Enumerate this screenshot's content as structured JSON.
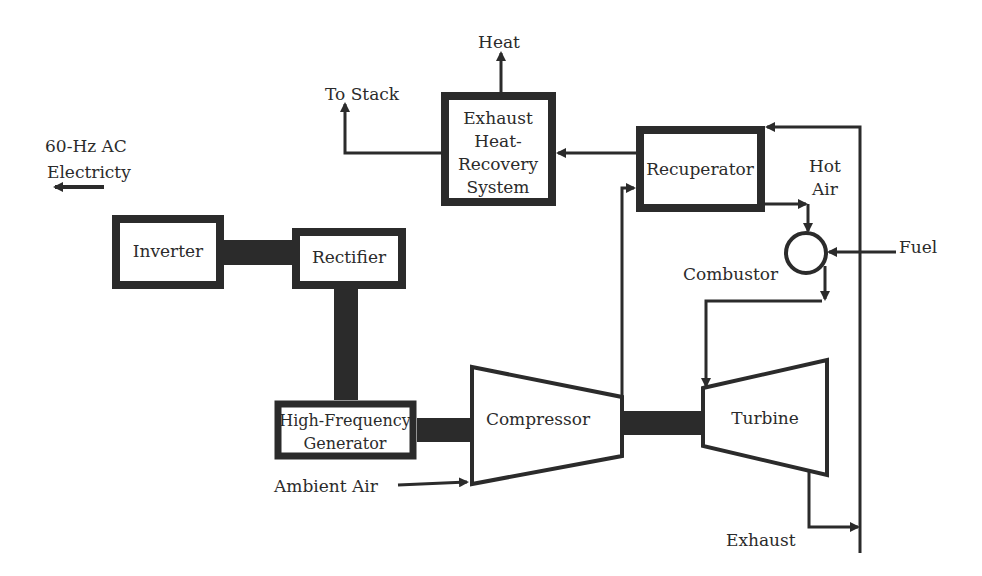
{
  "diagram": {
    "colors": {
      "ink": "#2b2b2b",
      "background": "#ffffff"
    },
    "components": {
      "exhaust_hrs": {
        "line1": "Exhaust",
        "line2": "Heat-",
        "line3": "Recovery",
        "line4": "System"
      },
      "recuperator": {
        "label": "Recuperator"
      },
      "inverter": {
        "label": "Inverter"
      },
      "rectifier": {
        "label": "Rectifier"
      },
      "generator": {
        "line1": "High-Frequency",
        "line2": "Generator"
      },
      "compressor": {
        "label": "Compressor"
      },
      "turbine": {
        "label": "Turbine"
      },
      "combustor": {
        "label": "Combustor"
      }
    },
    "flows": {
      "heat": "Heat",
      "to_stack": "To Stack",
      "ac_output_line1": "60-Hz AC",
      "ac_output_line2": "Electricty",
      "hot_air_line1": "Hot",
      "hot_air_line2": "Air",
      "fuel": "Fuel",
      "ambient_air": "Ambient Air",
      "exhaust": "Exhaust"
    }
  }
}
